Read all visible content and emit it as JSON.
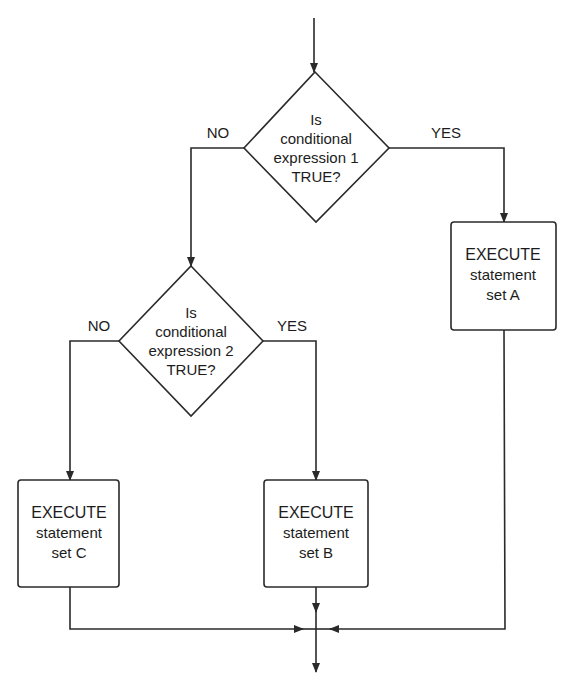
{
  "diagram": {
    "type": "flowchart",
    "decisions": [
      {
        "id": "d1",
        "lines": [
          "Is",
          "conditional",
          "expression 1",
          "TRUE?"
        ],
        "no_label": "NO",
        "yes_label": "YES"
      },
      {
        "id": "d2",
        "lines": [
          "Is",
          "conditional",
          "expression 2",
          "TRUE?"
        ],
        "no_label": "NO",
        "yes_label": "YES"
      }
    ],
    "processes": [
      {
        "id": "A",
        "lines": [
          "EXECUTE",
          "statement",
          "set A"
        ]
      },
      {
        "id": "B",
        "lines": [
          "EXECUTE",
          "statement",
          "set B"
        ]
      },
      {
        "id": "C",
        "lines": [
          "EXECUTE",
          "statement",
          "set C"
        ]
      }
    ],
    "colors": {
      "stroke": "#2a2a2a",
      "text": "#1c1c1c",
      "background": "#ffffff"
    }
  }
}
